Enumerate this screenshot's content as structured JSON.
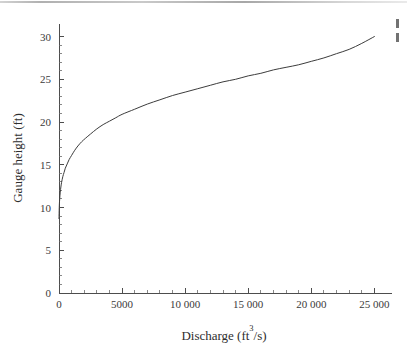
{
  "figure": {
    "background_color": "#ffffff",
    "curve_color": "#3c3c3c",
    "axis_color": "#4d4d4d",
    "text_color": "#3a3a3a"
  },
  "chart_data": {
    "type": "line",
    "title": "",
    "xlabel": "Discharge (ft3/s)",
    "xlabel_main": "Discharge (ft",
    "xlabel_sup": "3",
    "xlabel_tail": "/s)",
    "ylabel": "Gauge height (ft)",
    "xlim": [
      0,
      26000
    ],
    "ylim": [
      0,
      31
    ],
    "grid": false,
    "legend": "none",
    "x_ticks": [
      0,
      5000,
      10000,
      15000,
      20000,
      25000
    ],
    "x_tick_labels": [
      "0",
      "5000",
      "10 000",
      "15 000",
      "20 000",
      "25 000"
    ],
    "x_minor_ticks": [
      1000,
      2000,
      3000,
      4000,
      6000,
      7000,
      8000,
      9000,
      11000,
      12000,
      13000,
      14000,
      16000,
      17000,
      18000,
      19000,
      21000,
      22000,
      23000,
      24000
    ],
    "y_ticks": [
      0,
      5,
      10,
      15,
      20,
      25,
      30
    ],
    "y_tick_labels": [
      "0",
      "5",
      "10",
      "15",
      "20",
      "25",
      "30"
    ],
    "y_minor_ticks": [
      1,
      2,
      3,
      4,
      6,
      7,
      8,
      9,
      11,
      12,
      13,
      14,
      16,
      17,
      18,
      19,
      21,
      22,
      23,
      24,
      26,
      27,
      28,
      29
    ],
    "series": [
      {
        "name": "Rating curve",
        "color": "#3c3c3c",
        "x": [
          0,
          20,
          50,
          100,
          150,
          200,
          300,
          400,
          500,
          650,
          800,
          1000,
          1250,
          1500,
          1800,
          2100,
          2500,
          3000,
          3500,
          4000,
          4500,
          5000,
          6000,
          7000,
          8000,
          9000,
          10000,
          11000,
          12000,
          13000,
          14000,
          15000,
          16000,
          17000,
          18000,
          19000,
          20000,
          21000,
          22000,
          23000,
          24000,
          25000
        ],
        "y": [
          8.7,
          10.0,
          10.9,
          11.8,
          12.4,
          12.9,
          13.6,
          14.1,
          14.6,
          15.1,
          15.6,
          16.1,
          16.7,
          17.2,
          17.7,
          18.1,
          18.6,
          19.2,
          19.7,
          20.1,
          20.5,
          20.9,
          21.5,
          22.1,
          22.6,
          23.1,
          23.5,
          23.9,
          24.3,
          24.7,
          25.0,
          25.4,
          25.7,
          26.1,
          26.4,
          26.7,
          27.1,
          27.5,
          28.0,
          28.5,
          29.2,
          30.0
        ]
      }
    ]
  },
  "annotations": {
    "top_scan_line": "scanner-artifact-line",
    "right_edge_marks": "clipped-text-fragment"
  }
}
